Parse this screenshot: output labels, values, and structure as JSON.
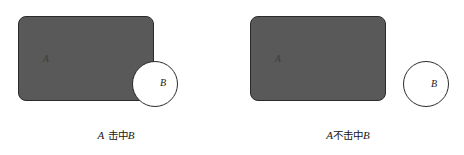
{
  "figure": {
    "background_color": "#ffffff",
    "shape_fill_color": "#595959",
    "shape_stroke_color": "#2b2b2b",
    "circle_fill_color": "#ffffff",
    "text_color": "#161616"
  },
  "panels": [
    {
      "id": "hit",
      "rect_label": "A",
      "circle_label": "B",
      "caption": {
        "full": "A 击中B",
        "lead": "A",
        "middle": " 击中",
        "trail": "B"
      },
      "relation": "overlapping"
    },
    {
      "id": "miss",
      "rect_label": "A",
      "circle_label": "B",
      "caption": {
        "full": "A不击中B",
        "lead": "A",
        "middle": "不击中",
        "trail": "B"
      },
      "relation": "disjoint"
    }
  ]
}
